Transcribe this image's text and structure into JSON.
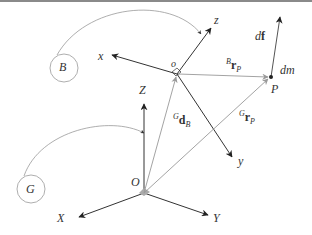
{
  "diagram": {
    "frames": {
      "body": {
        "circle_label": "B",
        "origin_label": "o",
        "axes": {
          "x": "x",
          "y": "y",
          "z": "z"
        }
      },
      "global": {
        "circle_label": "G",
        "origin_label": "O",
        "axes": {
          "X": "X",
          "Y": "Y",
          "Z": "Z"
        }
      }
    },
    "vectors": {
      "d_B": {
        "sup": "G",
        "main": "d",
        "sub": "B"
      },
      "r_P_global": {
        "sup": "G",
        "main": "r",
        "sub": "P"
      },
      "r_P_body": {
        "sup": "B",
        "main": "r",
        "sub": "P"
      },
      "df": {
        "prefix": "d",
        "main": "f"
      }
    },
    "point": {
      "label": "P",
      "mass_label": "dm"
    },
    "colors": {
      "axis": "#333333",
      "vector": "#888888",
      "circle": "#999999",
      "topbar": "#8a8a8a"
    }
  }
}
